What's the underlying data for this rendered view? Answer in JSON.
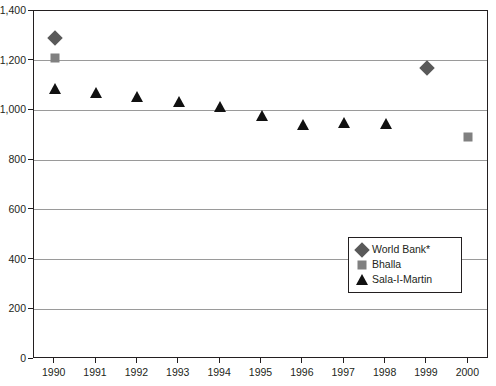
{
  "chart_data": {
    "type": "scatter",
    "title": "",
    "xlabel": "",
    "ylabel": "",
    "categories": [
      "1990",
      "1991",
      "1992",
      "1993",
      "1994",
      "1995",
      "1996",
      "1997",
      "1998",
      "1999",
      "2000"
    ],
    "x": [
      1990,
      1991,
      1992,
      1993,
      1994,
      1995,
      1996,
      1997,
      1998,
      1999,
      2000
    ],
    "xlim": [
      1989.5,
      2000.5
    ],
    "ylim": [
      0,
      1400
    ],
    "y_ticks": [
      0,
      200,
      400,
      600,
      800,
      1000,
      1200,
      1400
    ],
    "y_tick_labels": [
      "0",
      "200",
      "400",
      "600",
      "800",
      "1,000",
      "1,200",
      "1,400"
    ],
    "grid": true,
    "legend_position": "inside-right",
    "series": [
      {
        "name": "World Bank*",
        "marker": "diamond",
        "color": "#595959",
        "points": [
          {
            "x": 1990,
            "y": 1290
          },
          {
            "x": 1999,
            "y": 1170
          }
        ]
      },
      {
        "name": "Bhalla",
        "marker": "square",
        "color": "#808080",
        "points": [
          {
            "x": 1990,
            "y": 1210
          },
          {
            "x": 2000,
            "y": 895
          }
        ]
      },
      {
        "name": "Sala-I-Martin",
        "marker": "triangle",
        "color": "#111111",
        "points": [
          {
            "x": 1990,
            "y": 1085
          },
          {
            "x": 1991,
            "y": 1072
          },
          {
            "x": 1992,
            "y": 1053
          },
          {
            "x": 1993,
            "y": 1032
          },
          {
            "x": 1994,
            "y": 1015
          },
          {
            "x": 1995,
            "y": 978
          },
          {
            "x": 1996,
            "y": 940
          },
          {
            "x": 1997,
            "y": 950
          },
          {
            "x": 1998,
            "y": 947
          }
        ]
      }
    ]
  },
  "legend": {
    "items": [
      {
        "label": "World Bank*"
      },
      {
        "label": "Bhalla"
      },
      {
        "label": "Sala-I-Martin"
      }
    ]
  }
}
